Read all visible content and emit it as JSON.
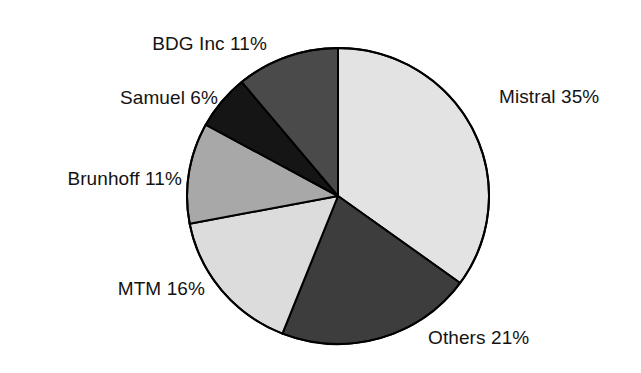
{
  "chart_data": {
    "type": "pie",
    "title": "",
    "subtitle": "",
    "xlabel": "",
    "ylabel": "",
    "legend_position": "none",
    "grid": false,
    "labels_show_percent": true,
    "total_percent": 100,
    "start_angle_deg": 0,
    "direction": "clockwise",
    "categories": [
      "Mistral",
      "Others",
      "MTM",
      "Brunhoff",
      "Samuel",
      "BDG Inc"
    ],
    "values": [
      35,
      21,
      16,
      11,
      6,
      11
    ],
    "slices": [
      {
        "name": "Mistral",
        "value": 35,
        "label": "Mistral 35%",
        "color": "#e3e3e3",
        "label_x": 499,
        "label_y": 96,
        "label_anchor": "start"
      },
      {
        "name": "Others",
        "value": 21,
        "label": "Others 21%",
        "color": "#3d3d3d",
        "label_x": 428,
        "label_y": 337,
        "label_anchor": "start"
      },
      {
        "name": "MTM",
        "value": 16,
        "label": "MTM 16%",
        "color": "#dcdcdc",
        "label_x": 205,
        "label_y": 288,
        "label_anchor": "end"
      },
      {
        "name": "Brunhoff",
        "value": 11,
        "label": "Brunhoff 11%",
        "color": "#a8a8a8",
        "label_x": 182,
        "label_y": 178,
        "label_anchor": "end"
      },
      {
        "name": "Samuel",
        "value": 6,
        "label": "Samuel 6%",
        "color": "#151515",
        "label_x": 218,
        "label_y": 97,
        "label_anchor": "end"
      },
      {
        "name": "BDG Inc",
        "value": 11,
        "label": "BDG Inc 11%",
        "color": "#4a4a4a",
        "label_x": 267,
        "label_y": 43,
        "label_anchor": "end"
      }
    ],
    "geometry": {
      "center_x": 338,
      "center_y": 196,
      "radius_x": 151,
      "radius_y": 148,
      "outline_color": "#000000",
      "outline_width": 2
    },
    "background_color": "#ffffff"
  }
}
